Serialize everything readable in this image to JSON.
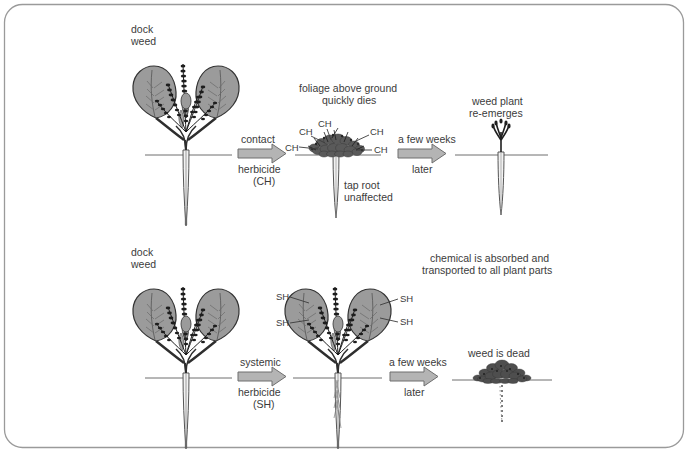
{
  "figure": {
    "title_visible": false,
    "border_color": "#9a9a9a",
    "background": "#ffffff",
    "text_color": "#3b3b3b",
    "leaf_fill": "#9b9b9b",
    "leaf_stroke": "#3a3a3a",
    "arrow_fill": "#b4b4b4",
    "arrow_stroke": "#6e6e6e",
    "ground_line_color": "#6f6f6f",
    "root_fill": "#efefef"
  },
  "rows": {
    "contact": {
      "name": "contact-herbicide-row",
      "stage1": {
        "label_line1": "dock",
        "label_line2": "weed",
        "plant": "healthy-dock-weed"
      },
      "arrow1": {
        "line1": "contact",
        "line2": "herbicide",
        "line3": "(CH)"
      },
      "stage2": {
        "label_line1": "foliage above ground",
        "label_line2": "quickly dies",
        "chemical_labels": [
          "CH",
          "CH",
          "CH",
          "CH"
        ],
        "root_label_line1": "tap root",
        "root_label_line2": "unaffected",
        "plant": "dead-foliage-with-live-taproot"
      },
      "arrow2": {
        "line1": "a few weeks",
        "line2": "later"
      },
      "stage3": {
        "label_line1": "weed plant",
        "label_line2": "re-emerges",
        "plant": "regrowing-sprout"
      }
    },
    "systemic": {
      "name": "systemic-herbicide-row",
      "stage1": {
        "label_line1": "dock",
        "label_line2": "weed",
        "plant": "healthy-dock-weed"
      },
      "arrow1": {
        "line1": "systemic",
        "line2": "herbicide",
        "line3": "(SH)"
      },
      "stage2": {
        "note_line1": "chemical is absorbed and",
        "note_line2": "transported to all plant parts",
        "chemical_labels": [
          "SH",
          "SH",
          "SH",
          "SH"
        ],
        "plant": "dock-weed-absorbing-chemical"
      },
      "arrow2": {
        "line1": "a few weeks",
        "line2": "later"
      },
      "stage3": {
        "label": "weed is dead",
        "plant": "dead-weed-with-dead-taproot"
      }
    }
  }
}
